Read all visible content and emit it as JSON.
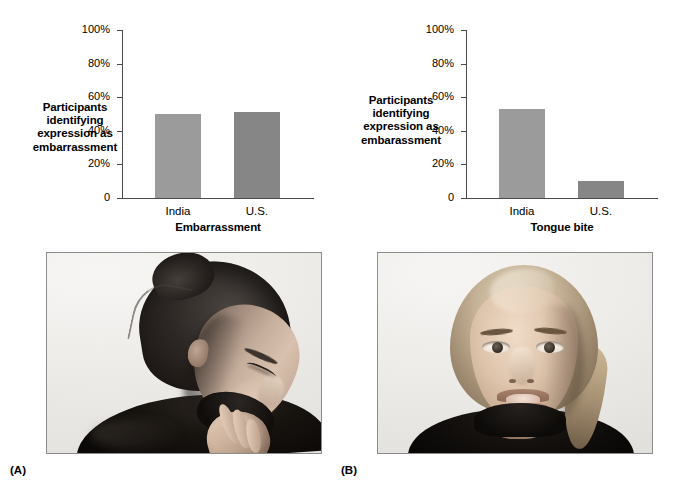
{
  "figure": {
    "panel_a_letter": "(A)",
    "panel_b_letter": "(B)"
  },
  "chart_data": [
    {
      "type": "bar",
      "id": "embarrassment",
      "title": "Embarrassment",
      "ylabel": "Participants identifying expression as embarrassment",
      "ylabel_lines": [
        "Participants",
        "identifying",
        "expression as",
        "embarrassment"
      ],
      "xlabel": "",
      "categories": [
        "India",
        "U.S."
      ],
      "values": [
        50,
        51
      ],
      "ylim": [
        0,
        100
      ],
      "ytick_labels": [
        "100%",
        "80%",
        "60%",
        "40%",
        "20%",
        "0"
      ],
      "ytick_values": [
        100,
        80,
        60,
        40,
        20,
        0
      ],
      "grid": false,
      "legend": "none",
      "bar_colors": [
        "#9b9b9b",
        "#868686"
      ]
    },
    {
      "type": "bar",
      "id": "tongue-bite",
      "title": "Tongue bite",
      "ylabel": "Participants identifying expression as embarassment",
      "ylabel_lines": [
        "Participants",
        "identifying",
        "expression as",
        "embarassment"
      ],
      "xlabel": "",
      "categories": [
        "India",
        "U.S."
      ],
      "values": [
        53,
        10
      ],
      "ylim": [
        0,
        100
      ],
      "ytick_labels": [
        "100%",
        "80%",
        "60%",
        "40%",
        "20%",
        "0"
      ],
      "ytick_values": [
        100,
        80,
        60,
        40,
        20,
        0
      ],
      "grid": false,
      "legend": "none",
      "bar_colors": [
        "#9b9b9b",
        "#868686"
      ]
    }
  ],
  "photos": {
    "a": {
      "caption": "(A)",
      "description": "Black-and-white photograph of a woman with dark hair in a bun, head lowered and turned, eyes downcast, hand raised to her mouth, wearing a dark turtleneck"
    },
    "b": {
      "caption": "(B)",
      "description": "Black-and-white photograph of a blonde woman facing the camera with her tongue held between her teeth, wearing a dark turtleneck"
    }
  },
  "colors": {
    "background": "#ffffff",
    "axis": "#4b4b4b",
    "text": "#000000",
    "bar_light": "#9b9b9b",
    "bar_dark": "#868686",
    "photo_border": "#8c8c8c"
  }
}
